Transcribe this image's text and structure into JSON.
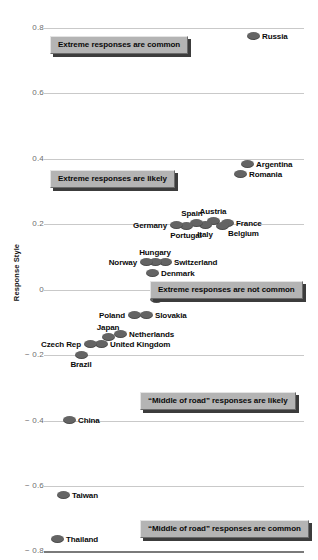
{
  "chart": {
    "y_axis_title": "Response Style",
    "y_ticks": [
      "0.8",
      "0.6",
      "0.4",
      "0.2",
      "0",
      "− 0.2",
      "− 0.4",
      "− 0.6",
      "− 0.8"
    ],
    "annotations": [
      {
        "text": "Extreme responses are common"
      },
      {
        "text": "Extreme responses are likely"
      },
      {
        "text": "Extreme responses are not common"
      },
      {
        "text": "“Middle of road” responses are likely"
      },
      {
        "text": "“Middle of road” responses are common"
      }
    ],
    "colors": {
      "dot": "#646464",
      "gridline": "#c9c9c9",
      "axis": "#7a7a7a",
      "callout_fill": "#b4b4b4",
      "callout_shadow": "#3c3c3c",
      "tick_text": "#6e6e6e",
      "label_text": "#0a0a0a"
    },
    "labels": {
      "russia": "Russia",
      "argentina": "Argentina",
      "romania": "Romania",
      "austria": "Austria",
      "france": "France",
      "spain": "Spain",
      "belgium": "Belgium",
      "germany": "Germany",
      "italy": "Italy",
      "portugal": "Portugal",
      "hungary": "Hungary",
      "norway": "Norway",
      "switzerland": "Switzerland",
      "denmark": "Denmark",
      "united_states": "United States",
      "poland": "Poland",
      "slovakia": "Slovakia",
      "japan": "Japan",
      "czech_rep": "Czech Rep",
      "netherlands": "Netherlands",
      "united_kingdom": "United Kingdom",
      "brazil": "Brazil",
      "china": "China",
      "taiwan": "Taiwan",
      "thailand": "Thailand"
    }
  },
  "chart_data": {
    "type": "scatter",
    "title": "",
    "xlabel": "",
    "ylabel": "Response Style",
    "ylim": [
      -0.8,
      0.8
    ],
    "ytick_values": [
      0.8,
      0.6,
      0.4,
      0.2,
      0,
      -0.2,
      -0.4,
      -0.6,
      -0.8
    ],
    "grid": "horizontal",
    "legend": "none",
    "note": "Countries ordered along an implicit horizontal jitter axis; vertical position encodes Response Style score.",
    "points": [
      {
        "label": "Russia",
        "y": 0.775,
        "px": 253,
        "py": 36,
        "label_pos": "right"
      },
      {
        "label": "Argentina",
        "y": 0.385,
        "px": 247,
        "py": 164,
        "label_pos": "right"
      },
      {
        "label": "Romania",
        "y": 0.354,
        "px": 240,
        "py": 174,
        "label_pos": "right"
      },
      {
        "label": "France",
        "y": 0.205,
        "px": 227,
        "py": 223,
        "label_pos": "right"
      },
      {
        "label": "Belgium",
        "y": 0.196,
        "px": 222,
        "py": 226,
        "label_pos": "below-right"
      },
      {
        "label": "Austria",
        "y": 0.211,
        "px": 213,
        "py": 221,
        "label_pos": "above"
      },
      {
        "label": "Italy",
        "y": 0.199,
        "px": 205,
        "py": 225,
        "label_pos": "below"
      },
      {
        "label": "Spain",
        "y": 0.206,
        "px": 196,
        "py": 223,
        "label_pos": "above-left"
      },
      {
        "label": "Portugal",
        "y": 0.196,
        "px": 186,
        "py": 226,
        "label_pos": "below"
      },
      {
        "label": "Germany",
        "y": 0.199,
        "px": 176,
        "py": 225,
        "label_pos": "left"
      },
      {
        "label": "Switzerland",
        "y": 0.086,
        "px": 165,
        "py": 262,
        "label_pos": "right"
      },
      {
        "label": "Hungary",
        "y": 0.086,
        "px": 155,
        "py": 262,
        "label_pos": "above"
      },
      {
        "label": "Norway",
        "y": 0.086,
        "px": 146,
        "py": 262,
        "label_pos": "left"
      },
      {
        "label": "Denmark",
        "y": 0.052,
        "px": 152,
        "py": 273,
        "label_pos": "right"
      },
      {
        "label": "United States",
        "y": -0.027,
        "px": 156,
        "py": 299,
        "label_pos": "right"
      },
      {
        "label": "Slovakia",
        "y": -0.077,
        "px": 146,
        "py": 315,
        "label_pos": "right"
      },
      {
        "label": "Poland",
        "y": -0.077,
        "px": 134,
        "py": 315,
        "label_pos": "left"
      },
      {
        "label": "Netherlands",
        "y": -0.134,
        "px": 120,
        "py": 334,
        "label_pos": "right"
      },
      {
        "label": "Japan",
        "y": -0.143,
        "px": 108,
        "py": 337,
        "label_pos": "above"
      },
      {
        "label": "United Kingdom",
        "y": -0.165,
        "px": 101,
        "py": 344,
        "label_pos": "right"
      },
      {
        "label": "Czech Rep",
        "y": -0.165,
        "px": 90,
        "py": 344,
        "label_pos": "left"
      },
      {
        "label": "Brazil",
        "y": -0.199,
        "px": 81,
        "py": 355,
        "label_pos": "below"
      },
      {
        "label": "China",
        "y": -0.397,
        "px": 69,
        "py": 420,
        "label_pos": "right"
      },
      {
        "label": "Taiwan",
        "y": -0.625,
        "px": 63,
        "py": 495,
        "label_pos": "right"
      },
      {
        "label": "Thailand",
        "y": -0.759,
        "px": 57,
        "py": 539,
        "label_pos": "right"
      }
    ],
    "annotations": [
      {
        "text": "Extreme responses are common",
        "y_region": 0.7,
        "px": 50,
        "py": 36
      },
      {
        "text": "Extreme responses are likely",
        "y_region": 0.33,
        "px": 50,
        "py": 170
      },
      {
        "text": "Extreme responses are not common",
        "y_region": -0.01,
        "px": 150,
        "py": 281
      },
      {
        "text": "“Middle of road” responses are likely",
        "y_region": -0.33,
        "px": 140,
        "py": 392
      },
      {
        "text": "“Middle of road” responses are common",
        "y_region": -0.72,
        "px": 140,
        "py": 520
      }
    ]
  }
}
